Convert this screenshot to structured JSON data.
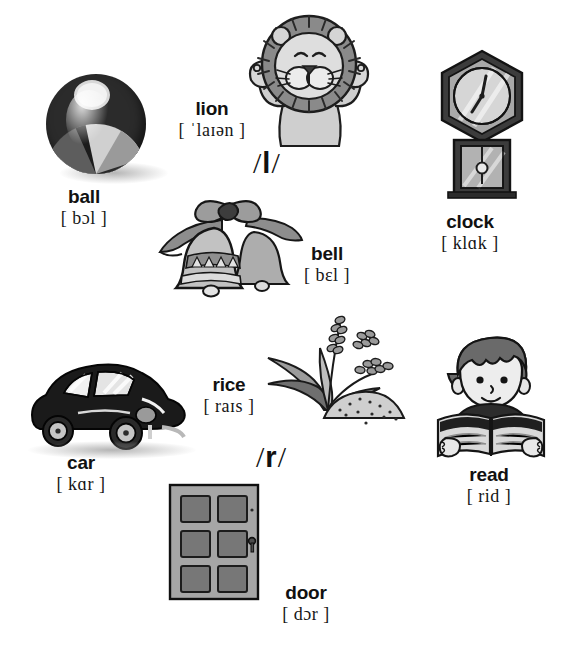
{
  "page": {
    "background": "#ffffff",
    "ink": "#111111"
  },
  "sections": [
    {
      "id": "l-section",
      "phoneme_label": "/ l /",
      "phoneme_letter": "l",
      "entries": [
        {
          "id": "ball",
          "word": "ball",
          "ipa": "[ bɔl ]",
          "icon": "beach-ball-illustration"
        },
        {
          "id": "lion",
          "word": "lion",
          "ipa": "[ ˈlaɪən ]",
          "icon": "lion-illustration"
        },
        {
          "id": "clock",
          "word": "clock",
          "ipa": "[ klɑk ]",
          "icon": "wall-clock-illustration"
        },
        {
          "id": "bell",
          "word": "bell",
          "ipa": "[ bɛl ]",
          "icon": "bells-illustration"
        }
      ]
    },
    {
      "id": "r-section",
      "phoneme_label": "/ r /",
      "phoneme_letter": "r",
      "entries": [
        {
          "id": "car",
          "word": "car",
          "ipa": "[ kɑr ]",
          "icon": "car-illustration"
        },
        {
          "id": "rice",
          "word": "rice",
          "ipa": "[ raɪs ]",
          "icon": "rice-plant-illustration"
        },
        {
          "id": "read",
          "word": "read",
          "ipa": "[ rid ]",
          "icon": "reading-boy-illustration"
        },
        {
          "id": "door",
          "word": "door",
          "ipa": "[ dɔr ]",
          "icon": "door-illustration"
        }
      ]
    }
  ],
  "phonemes": {
    "l": {
      "slash_open": "/",
      "letter": "l",
      "slash_close": "/"
    },
    "r": {
      "slash_open": "/",
      "letter": "r",
      "slash_close": "/"
    }
  },
  "colors": {
    "ink": "#111111",
    "mid_grey": "#8d8d8d",
    "light_grey": "#c9c9c9",
    "dark_grey": "#4a4a4a",
    "paper": "#ffffff"
  }
}
